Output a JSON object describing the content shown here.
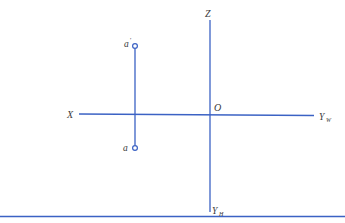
{
  "diagram": {
    "type": "orthographic projection of a point",
    "colors": {
      "line": "#3b62c4",
      "text": "#3a3a3a",
      "background": "#ffffff"
    },
    "axes": {
      "z_label": "Z",
      "x_label": "X",
      "origin_label": "O",
      "yw_label": "Y",
      "yw_sub": "W",
      "yh_label": "Y",
      "yh_sub": "H"
    },
    "points": {
      "front_view_label": "a",
      "front_view_prime": "′",
      "top_view_label": "a"
    }
  }
}
